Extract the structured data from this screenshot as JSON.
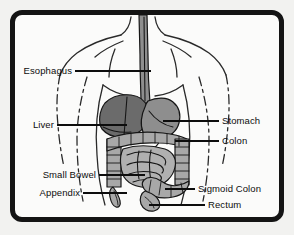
{
  "figure": {
    "frame_color": "#141414",
    "background_color": "#fbfbfa",
    "outer_margin_color": "#f2f2f0"
  },
  "colors": {
    "liver": "#6b6b6b",
    "stomach": "#8e8e8e",
    "colon": "#a8a8a8",
    "small_bowel": "#b0b0b0",
    "outline": "#161616",
    "body_outline": "#2a2a2a",
    "label": "#0d0d0d"
  },
  "labels": {
    "left": [
      {
        "id": "esophagus",
        "text": "Esophagus"
      },
      {
        "id": "liver",
        "text": "Liver"
      },
      {
        "id": "small-bowel",
        "text": "Small Bowel"
      },
      {
        "id": "appendix",
        "text": "Appendix"
      }
    ],
    "right": [
      {
        "id": "stomach",
        "text": "Stomach"
      },
      {
        "id": "colon",
        "text": "Colon"
      },
      {
        "id": "sigmoid-colon",
        "text": "Sigmoid Colon"
      },
      {
        "id": "rectum",
        "text": "Rectum"
      }
    ]
  },
  "organs": [
    {
      "id": "esophagus",
      "name": "Esophagus"
    },
    {
      "id": "stomach",
      "name": "Stomach"
    },
    {
      "id": "liver",
      "name": "Liver"
    },
    {
      "id": "colon",
      "name": "Colon"
    },
    {
      "id": "small-bowel",
      "name": "Small Bowel"
    },
    {
      "id": "sigmoid-colon",
      "name": "Sigmoid Colon"
    },
    {
      "id": "rectum",
      "name": "Rectum"
    },
    {
      "id": "appendix",
      "name": "Appendix"
    }
  ]
}
